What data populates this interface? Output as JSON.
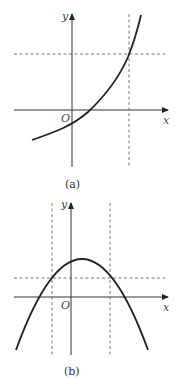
{
  "figures": [
    {
      "id": "a",
      "caption": "(a)",
      "x_axis_label": "x",
      "y_axis_label": "y",
      "origin_label": "O",
      "curve": "increasing exponential-like curve crossing the x-axis right of origin and y-axis below origin",
      "guides": {
        "vertical_dashed": 1,
        "horizontal_dashed": 1
      }
    },
    {
      "id": "b",
      "caption": "(b)",
      "x_axis_label": "x",
      "y_axis_label": "y",
      "origin_label": "O",
      "curve": "downward-opening parabola with vertex slightly right of y-axis above x-axis",
      "guides": {
        "vertical_dashed": 2,
        "horizontal_dashed": 1
      }
    }
  ]
}
